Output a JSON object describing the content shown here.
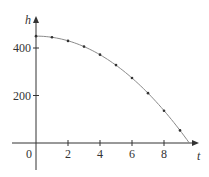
{
  "chart_data": {
    "type": "line",
    "title": "",
    "xlabel": "t",
    "ylabel": "h",
    "xlim": [
      -1.6,
      10.2
    ],
    "ylim": [
      -120,
      560
    ],
    "x_ticks": [
      0,
      2,
      4,
      6,
      8
    ],
    "x_tick_labels": [
      "0",
      "2",
      "4",
      "6",
      "8"
    ],
    "y_ticks": [
      200,
      400
    ],
    "y_tick_labels": [
      "200",
      "400"
    ],
    "grid": false,
    "legend": null,
    "series": [
      {
        "name": "h(t)",
        "curve": "h = 450 - 4.9 t^2",
        "x": [
          0,
          1,
          2,
          3,
          4,
          5,
          6,
          7,
          8,
          9
        ],
        "values": [
          450,
          445,
          430,
          406,
          372,
          328,
          274,
          210,
          136,
          53
        ],
        "end_x": 9.58
      }
    ],
    "colors": {
      "axis": "#333333",
      "curve": "#8a8a8a",
      "points": "#333333"
    }
  }
}
